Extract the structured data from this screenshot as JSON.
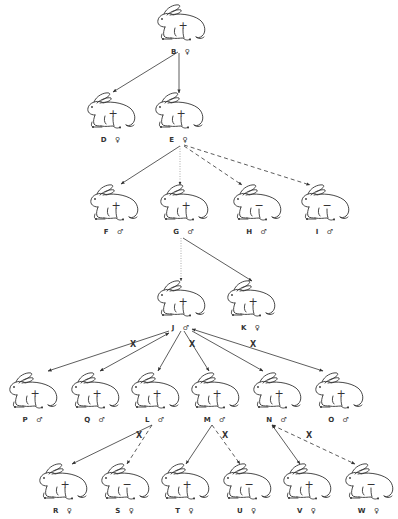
{
  "diagram": {
    "type": "pedigree",
    "colors": {
      "ink": "#333333",
      "background": "#ffffff"
    },
    "nodes": [
      {
        "id": "B",
        "label": "B ♀",
        "marker": "+",
        "x": 152,
        "y": 2
      },
      {
        "id": "D",
        "label": "D ♀",
        "marker": "+",
        "x": 82,
        "y": 90
      },
      {
        "id": "E",
        "label": "E ♀",
        "marker": "+",
        "x": 150,
        "y": 90
      },
      {
        "id": "F",
        "label": "F ♂",
        "marker": "+",
        "x": 85,
        "y": 182
      },
      {
        "id": "G",
        "label": "G ♂",
        "marker": "+",
        "x": 155,
        "y": 182
      },
      {
        "id": "H",
        "label": "H ♂",
        "marker": "−",
        "x": 228,
        "y": 182
      },
      {
        "id": "I",
        "label": "I ♂",
        "marker": "−",
        "x": 296,
        "y": 182
      },
      {
        "id": "J",
        "label": "J ♂",
        "marker": "+",
        "x": 152,
        "y": 278
      },
      {
        "id": "K",
        "label": "K ♀",
        "marker": "+",
        "x": 222,
        "y": 278
      },
      {
        "id": "P",
        "label": "P ♂",
        "marker": "+",
        "x": 4,
        "y": 370
      },
      {
        "id": "Q",
        "label": "Q ♂",
        "marker": "+",
        "x": 66,
        "y": 370
      },
      {
        "id": "L",
        "label": "L ♂",
        "marker": "+",
        "x": 126,
        "y": 370
      },
      {
        "id": "M",
        "label": "M ♂",
        "marker": "+",
        "x": 186,
        "y": 370
      },
      {
        "id": "N",
        "label": "N ♂",
        "marker": "+",
        "x": 248,
        "y": 370
      },
      {
        "id": "O",
        "label": "O ♂",
        "marker": "+",
        "x": 310,
        "y": 370
      },
      {
        "id": "R",
        "label": "R ♀",
        "marker": "+",
        "x": 34,
        "y": 461
      },
      {
        "id": "S",
        "label": "S ♀",
        "marker": "−",
        "x": 96,
        "y": 461
      },
      {
        "id": "T",
        "label": "T ♀",
        "marker": "+",
        "x": 156,
        "y": 461
      },
      {
        "id": "U",
        "label": "U ♀",
        "marker": "−",
        "x": 218,
        "y": 461
      },
      {
        "id": "V",
        "label": "V ♀",
        "marker": "+",
        "x": 278,
        "y": 461
      },
      {
        "id": "W",
        "label": "W ♀",
        "marker": "−",
        "x": 340,
        "y": 461
      }
    ],
    "edges": [
      {
        "from": "B",
        "to": "D",
        "style": "solid",
        "x1": 178,
        "y1": 52,
        "x2": 113,
        "y2": 92
      },
      {
        "from": "B",
        "to": "E",
        "style": "solid",
        "x1": 179,
        "y1": 53,
        "x2": 179,
        "y2": 93
      },
      {
        "from": "E",
        "to": "F",
        "style": "solid",
        "x1": 180,
        "y1": 146,
        "x2": 121,
        "y2": 184
      },
      {
        "from": "E",
        "to": "G",
        "style": "dotted",
        "x1": 180,
        "y1": 146,
        "x2": 180,
        "y2": 185
      },
      {
        "from": "E",
        "to": "H",
        "style": "dashed",
        "x1": 184,
        "y1": 146,
        "x2": 242,
        "y2": 185
      },
      {
        "from": "E",
        "to": "I",
        "style": "dashed",
        "x1": 184,
        "y1": 145,
        "x2": 310,
        "y2": 185
      },
      {
        "from": "G",
        "to": "J",
        "style": "dotted",
        "x1": 181,
        "y1": 238,
        "x2": 181,
        "y2": 281
      },
      {
        "from": "G",
        "to": "K",
        "style": "solid",
        "x1": 183,
        "y1": 238,
        "x2": 252,
        "y2": 281
      },
      {
        "from": "J",
        "to": "P",
        "style": "solid",
        "x1": 169,
        "y1": 331,
        "x2": 48,
        "y2": 371,
        "arrow": "end"
      },
      {
        "from": "J",
        "to": "Q",
        "style": "solid",
        "x1": 169,
        "y1": 333,
        "x2": 100,
        "y2": 371,
        "arrow": "both",
        "x_mark": true
      },
      {
        "from": "J",
        "to": "L",
        "style": "solid",
        "x1": 181,
        "y1": 331,
        "x2": 158,
        "y2": 371,
        "arrow": "end"
      },
      {
        "from": "J",
        "to": "M",
        "style": "solid",
        "x1": 184,
        "y1": 331,
        "x2": 209,
        "y2": 371,
        "arrow": "end",
        "x_mark": true
      },
      {
        "from": "J",
        "to": "N",
        "style": "solid",
        "x1": 192,
        "y1": 331,
        "x2": 263,
        "y2": 371,
        "arrow": "end"
      },
      {
        "from": "J",
        "to": "O",
        "style": "solid",
        "x1": 192,
        "y1": 329,
        "x2": 323,
        "y2": 371,
        "arrow": "both",
        "x_mark": true
      },
      {
        "from": "L",
        "to": "R",
        "style": "solid",
        "x1": 152,
        "y1": 425,
        "x2": 72,
        "y2": 464
      },
      {
        "from": "L",
        "to": "S",
        "style": "dashed",
        "x1": 152,
        "y1": 425,
        "x2": 127,
        "y2": 464,
        "x_mark": true
      },
      {
        "from": "M",
        "to": "T",
        "style": "solid",
        "x1": 212,
        "y1": 425,
        "x2": 186,
        "y2": 464
      },
      {
        "from": "M",
        "to": "U",
        "style": "dashed",
        "x1": 212,
        "y1": 425,
        "x2": 240,
        "y2": 464,
        "x_mark": true
      },
      {
        "from": "N",
        "to": "V",
        "style": "solid",
        "x1": 272,
        "y1": 425,
        "x2": 300,
        "y2": 464,
        "arrow": "both"
      },
      {
        "from": "N",
        "to": "W",
        "style": "dashed",
        "x1": 272,
        "y1": 425,
        "x2": 355,
        "y2": 464,
        "arrow": "both",
        "x_mark": true
      }
    ],
    "x_marks": [
      {
        "label": "X",
        "x": 133,
        "y": 345
      },
      {
        "label": "X",
        "x": 192,
        "y": 345
      },
      {
        "label": "X",
        "x": 253,
        "y": 345
      },
      {
        "label": "X",
        "x": 139,
        "y": 436
      },
      {
        "label": "X",
        "x": 225,
        "y": 436
      },
      {
        "label": "X",
        "x": 309,
        "y": 436
      }
    ]
  }
}
